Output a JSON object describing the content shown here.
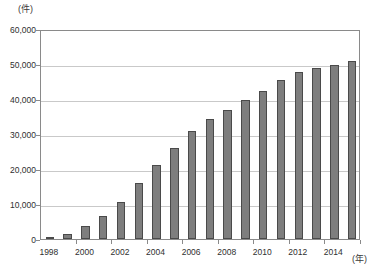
{
  "chart_data": {
    "type": "bar",
    "title": "",
    "xlabel": "(年)",
    "ylabel": "(件)",
    "ylim": [
      0,
      60000
    ],
    "ytick_labels": [
      "0",
      "10,000",
      "20,000",
      "30,000",
      "40,000",
      "50,000",
      "60,000"
    ],
    "ytick_values": [
      0,
      10000,
      20000,
      30000,
      40000,
      50000,
      60000
    ],
    "grid": true,
    "legend": "none",
    "categories": [
      "1998",
      "1999",
      "2000",
      "2001",
      "2002",
      "2003",
      "2004",
      "2005",
      "2006",
      "2007",
      "2008",
      "2009",
      "2010",
      "2011",
      "2012",
      "2013",
      "2014",
      "2015"
    ],
    "xtick_labels_shown": [
      "1998",
      "2000",
      "2002",
      "2004",
      "2006",
      "2008",
      "2010",
      "2012",
      "2014"
    ],
    "values": [
      300,
      1500,
      3700,
      6700,
      10700,
      16000,
      21200,
      26000,
      31000,
      34200,
      36900,
      39700,
      42400,
      45300,
      47600,
      49000,
      49700,
      51000
    ],
    "bar_color": "#7e7e7e",
    "bar_edge_color": "#4a4a4a",
    "gridline_color": "#c9c9c9",
    "axis_color": "#8a8a8a"
  }
}
